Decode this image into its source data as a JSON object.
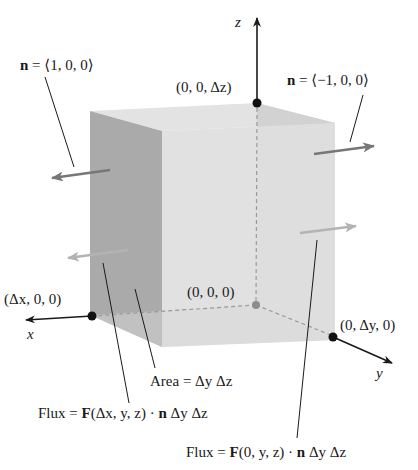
{
  "axes": {
    "x_label": "x",
    "y_label": "y",
    "z_label": "z"
  },
  "points": {
    "origin": "(0, 0, 0)",
    "dx": "(Δx, 0, 0)",
    "dy": "(0, Δy, 0)",
    "dz": "(0, 0, Δz)"
  },
  "normals": {
    "left_bold": "n",
    "left_rest": " = ⟨1, 0, 0⟩",
    "right_bold": "n",
    "right_rest": " = ⟨−1, 0, 0⟩"
  },
  "annotations": {
    "area": "Area = Δy Δz",
    "flux_front_prefix": "Flux = ",
    "flux_front_F": "F",
    "flux_front_args": "(Δx, y, z) · ",
    "flux_front_n": "n",
    "flux_front_suffix": " Δy Δz",
    "flux_back_prefix": "Flux = ",
    "flux_back_F": "F",
    "flux_back_args": "(0, y, z) · ",
    "flux_back_n": "n",
    "flux_back_suffix": " Δy Δz"
  },
  "colors": {
    "left_face": "#a9a9a9",
    "front_face": "#dcdcdc",
    "right_face": "#cfcfcf",
    "top_face": "#e2e2e2",
    "arrow_dark": "#7a7a7a",
    "arrow_light": "#b5b5b5",
    "ink": "#1a1a1a"
  }
}
